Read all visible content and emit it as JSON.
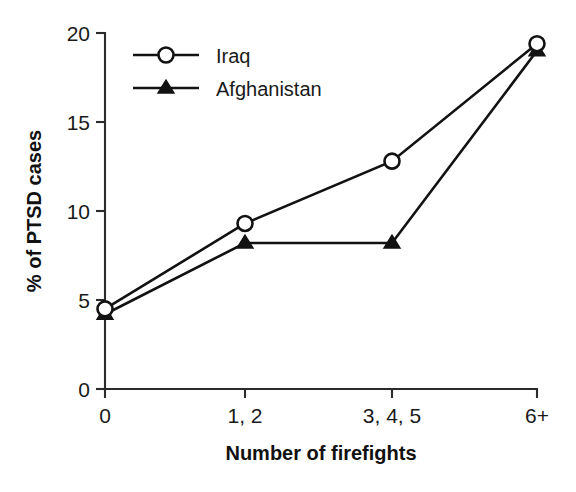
{
  "chart_data": {
    "type": "line",
    "title": "",
    "subtitle": "",
    "xlabel": "Number of firefights",
    "ylabel": "% of PTSD cases",
    "categories": [
      "0",
      "1, 2",
      "3, 4, 5",
      "6+"
    ],
    "xticklabels": [
      "0",
      "1, 2",
      "3, 4, 5",
      "6+"
    ],
    "yticklabels": [
      "0",
      "5",
      "10",
      "15",
      "20"
    ],
    "yticks": [
      0,
      5,
      10,
      15,
      20
    ],
    "ylim": [
      0,
      20
    ],
    "grid": false,
    "legend_position": "upper left inside",
    "series": [
      {
        "name": "Iraq",
        "marker": "open-circle",
        "color": "#121212",
        "values": [
          4.5,
          9.3,
          12.8,
          19.4
        ]
      },
      {
        "name": "Afghanistan",
        "marker": "filled-triangle",
        "color": "#121212",
        "values": [
          4.2,
          8.2,
          8.2,
          19.0
        ]
      }
    ]
  },
  "legend": {
    "entries": [
      {
        "label": "Iraq",
        "marker": "open-circle-marker"
      },
      {
        "label": "Afghanistan",
        "marker": "filled-triangle-marker"
      }
    ]
  },
  "axes": {
    "y_title": "% of PTSD cases",
    "x_title": "Number of firefights",
    "y_tick_0": "0",
    "y_tick_5": "5",
    "y_tick_10": "10",
    "y_tick_15": "15",
    "y_tick_20": "20",
    "x_tick_0": "0",
    "x_tick_1": "1, 2",
    "x_tick_2": "3, 4, 5",
    "x_tick_3": "6+"
  },
  "colors": {
    "ink": "#121212",
    "axis": "#2b2b2b",
    "background": "#ffffff"
  }
}
